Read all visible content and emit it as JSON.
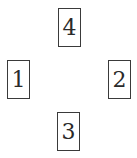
{
  "diagram": {
    "boxes": [
      {
        "id": "top",
        "label": "4"
      },
      {
        "id": "left",
        "label": "1"
      },
      {
        "id": "right",
        "label": "2"
      },
      {
        "id": "bottom",
        "label": "3"
      }
    ],
    "colors": {
      "border": "#3a3a3a",
      "text": "#2a2a2a",
      "background": "#ffffff"
    }
  }
}
